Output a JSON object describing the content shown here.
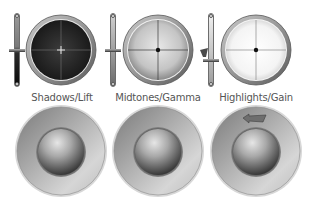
{
  "wheels": [
    {
      "label": "Shadows/Lift",
      "tone": "dark",
      "slider_level": 0.5,
      "colors": {
        "fill_center": "#3a3a3a",
        "fill_edge": "#1e1e1e",
        "crosshair": "#7a7a7a",
        "center_mark": "#e6e6e6"
      }
    },
    {
      "label": "Midtones/Gamma",
      "tone": "mid",
      "slider_level": 0.5,
      "colors": {
        "fill_center": "#e4e4e4",
        "fill_edge": "#9a9a9a",
        "crosshair": "#3a3a3a",
        "center_mark": "#111111"
      }
    },
    {
      "label": "Highlights/Gain",
      "tone": "light",
      "slider_level": 0.4,
      "has_pointer": true,
      "colors": {
        "fill_center": "#ffffff",
        "fill_edge": "#d6d6d6",
        "crosshair": "#8a8a8a",
        "center_mark": "#111111"
      }
    }
  ],
  "trackballs": [
    {
      "name": "shadows-trackball",
      "has_arrow": false
    },
    {
      "name": "midtones-trackball",
      "has_arrow": false
    },
    {
      "name": "highlights-trackball",
      "has_arrow": true,
      "arrow_icon": "arrow-left-icon"
    }
  ]
}
